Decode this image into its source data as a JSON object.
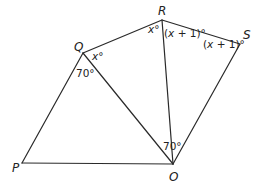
{
  "diagram": {
    "type": "geometry",
    "vertices": {
      "P": {
        "label": "P",
        "x": 22,
        "y": 163
      },
      "O": {
        "label": "O",
        "x": 173,
        "y": 164
      },
      "Q": {
        "label": "Q",
        "x": 83,
        "y": 53
      },
      "R": {
        "label": "R",
        "x": 162,
        "y": 20
      },
      "S": {
        "label": "S",
        "x": 240,
        "y": 44
      }
    },
    "edges": [
      [
        "P",
        "Q"
      ],
      [
        "Q",
        "R"
      ],
      [
        "R",
        "S"
      ],
      [
        "S",
        "O"
      ],
      [
        "O",
        "P"
      ],
      [
        "Q",
        "O"
      ],
      [
        "R",
        "O"
      ]
    ],
    "angles": {
      "Q_RQO": {
        "vertex": "Q",
        "text": "x°",
        "var": "x",
        "deg": "°"
      },
      "Q_PQO": {
        "vertex": "Q",
        "text": "70°"
      },
      "R_QRO": {
        "vertex": "R",
        "text": "x°",
        "var": "x",
        "deg": "°"
      },
      "R_ORS": {
        "vertex": "R",
        "text": "(x + 1)°",
        "open": "(",
        "var": "x",
        "rest": " + 1)°"
      },
      "S_RSO": {
        "vertex": "S",
        "text": "(x + 1)°",
        "open": "(",
        "var": "x",
        "rest": " + 1)°"
      },
      "O_QOR": {
        "vertex": "O",
        "text": "70°"
      }
    }
  }
}
